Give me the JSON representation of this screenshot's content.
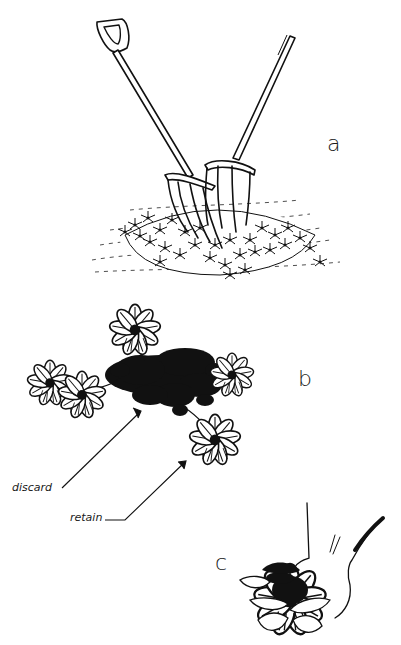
{
  "figure": {
    "panels": [
      {
        "id": "a",
        "label": "a",
        "subject": "two forks inserted back-to-back into a clump of plants"
      },
      {
        "id": "b",
        "label": "b",
        "subject": "clump divided; dark central portion and outer rosettes"
      },
      {
        "id": "c",
        "label": "c",
        "subject": "hand holding a single rosette division"
      }
    ],
    "annotations": {
      "discard": "discard",
      "retain": "retain"
    },
    "colors": {
      "ink": "#111111",
      "paper": "#ffffff"
    }
  }
}
